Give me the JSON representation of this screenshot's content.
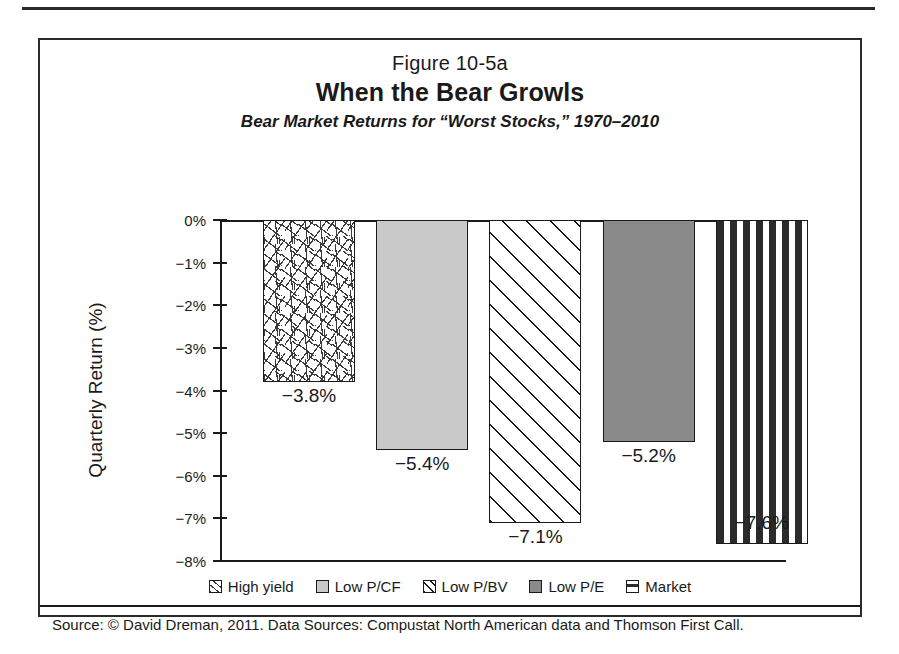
{
  "figure": {
    "number": "Figure 10-5a",
    "title": "When the Bear Growls",
    "subtitle": "Bear Market Returns for “Worst Stocks,” 1970–2010",
    "source": "Source: © David Dreman, 2011. Data Sources: Compustat North American data and Thomson First Call."
  },
  "chart_data": {
    "type": "bar",
    "title": "When the Bear Growls",
    "subtitle": "Bear Market Returns for “Worst Stocks,” 1970–2010",
    "xlabel": "",
    "ylabel": "Quarterly Return (%)",
    "ylim": [
      -8,
      0
    ],
    "grid": false,
    "legend_position": "bottom",
    "categories": [
      "High yield",
      "Low P/CF",
      "Low P/BV",
      "Low P/E",
      "Market"
    ],
    "values": [
      -3.8,
      -5.4,
      -7.1,
      -5.2,
      -7.6
    ],
    "value_labels": [
      "−3.8%",
      "−5.4%",
      "−7.1%",
      "−5.2%",
      "−7.6%"
    ],
    "ytick_labels": [
      "0%",
      "−1%",
      "−2%",
      "−3%",
      "−4%",
      "−5%",
      "−6%",
      "−7%",
      "−8%"
    ],
    "ytick_values": [
      0,
      -1,
      -2,
      -3,
      -4,
      -5,
      -6,
      -7,
      -8
    ],
    "series": [
      {
        "name": "Bear Market Quarterly Return",
        "values": [
          -3.8,
          -5.4,
          -7.1,
          -5.2,
          -7.6
        ]
      }
    ],
    "fills": [
      "scattered-dashes",
      "light-gray-solid",
      "diagonal-hatch",
      "dark-gray-solid",
      "horizontal-dash-grid"
    ],
    "colors": {
      "high_yield": "#ffffff",
      "low_pcf": "#c9c9c9",
      "low_pbv": "#ffffff",
      "low_pe": "#8a8a8a",
      "market": "#ffffff",
      "axis": "#1a1a1a",
      "frame": "#2b2b2b"
    }
  },
  "legend": {
    "items": [
      {
        "label": "High yield"
      },
      {
        "label": "Low P/CF"
      },
      {
        "label": "Low P/BV"
      },
      {
        "label": "Low P/E"
      },
      {
        "label": "Market"
      }
    ]
  }
}
